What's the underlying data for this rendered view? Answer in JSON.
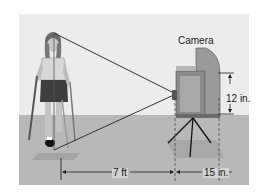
{
  "figure": {
    "labels": {
      "camera": "Camera",
      "camera_height": "12 in.",
      "distance_person_to_camera": "7 ft",
      "camera_depth": "15 in."
    },
    "colors": {
      "background": "#ececec",
      "ground": "#b8b8b8",
      "camera_body": "#8a8a8a",
      "lines": "#333333"
    }
  }
}
